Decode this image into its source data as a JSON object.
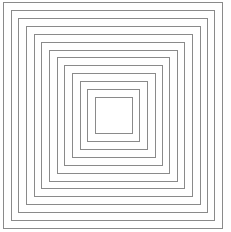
{
  "diagram": {
    "type": "concentric-squares",
    "ring_count": 13,
    "stroke_color": "#8a8a8a",
    "stroke_width": 1.5,
    "background_color": "#ffffff",
    "outer": {
      "left": 3,
      "top": 2,
      "right": 223,
      "bottom": 229
    },
    "inner": {
      "left": 95,
      "top": 97,
      "right": 133,
      "bottom": 134
    }
  }
}
